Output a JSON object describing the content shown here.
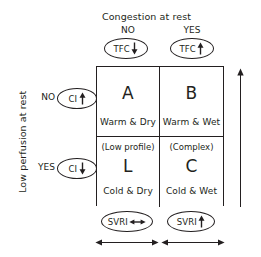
{
  "diagram": {
    "title_top": "Congestion at rest",
    "title_left": "Low perfusion at rest",
    "columns": [
      {
        "key": "no",
        "label": "NO"
      },
      {
        "key": "yes",
        "label": "YES"
      }
    ],
    "rows": [
      {
        "key": "no",
        "label": "NO"
      },
      {
        "key": "yes",
        "label": "YES"
      }
    ],
    "top_markers": [
      {
        "name": "tfc-no",
        "label": "TFC",
        "arrow": "down",
        "arrow_glyph": "↓"
      },
      {
        "name": "tfc-yes",
        "label": "TFC",
        "arrow": "up",
        "arrow_glyph": "↑"
      }
    ],
    "left_markers": [
      {
        "name": "ci-no",
        "label": "CI",
        "arrow": "up",
        "arrow_glyph": "↑"
      },
      {
        "name": "ci-yes",
        "label": "CI",
        "arrow": "down",
        "arrow_glyph": "↓"
      }
    ],
    "bottom_markers": [
      {
        "name": "svri-dry",
        "label": "SVRI",
        "arrow": "left-right",
        "arrow_glyph": "↔"
      },
      {
        "name": "svri-wet",
        "label": "SVRI",
        "arrow": "up",
        "arrow_glyph": "↑"
      }
    ],
    "quadrants": [
      {
        "name": "quadrant-a",
        "position": "top-left",
        "paren": "",
        "letter": "A",
        "subtitle": "Warm & Dry"
      },
      {
        "name": "quadrant-b",
        "position": "top-right",
        "paren": "",
        "letter": "B",
        "subtitle": "Warm & Wet"
      },
      {
        "name": "quadrant-l",
        "position": "bottom-left",
        "paren": "(Low profile)",
        "letter": "L",
        "subtitle": "Cold & Dry"
      },
      {
        "name": "quadrant-c",
        "position": "bottom-right",
        "paren": "(Complex)",
        "letter": "C",
        "subtitle": "Cold & Wet"
      }
    ],
    "axis_arrows": [
      {
        "name": "right-axis-arrow",
        "direction": "up"
      },
      {
        "name": "bottom-axis-arrow-left",
        "direction": "left-right"
      },
      {
        "name": "bottom-axis-arrow-right",
        "direction": "left-right"
      }
    ],
    "colors": {
      "ink": "#231f20",
      "background": "#ffffff"
    }
  }
}
